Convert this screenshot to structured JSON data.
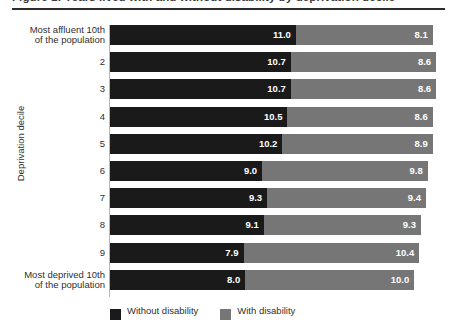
{
  "title": {
    "text": "Figure 1: Years lived with and without disability by deprivation decile"
  },
  "legend": {
    "items": [
      {
        "label": "Without disability",
        "color": "#1a1a1a"
      },
      {
        "label": "With disability",
        "color": "#767676"
      }
    ]
  },
  "axis": {
    "y_title": "Deprivation decile"
  },
  "chart_data": {
    "type": "bar",
    "orientation": "horizontal",
    "stacked": true,
    "title": "Figure 1: Years lived with and without disability by deprivation decile",
    "xlabel": "",
    "ylabel": "Deprivation decile",
    "grid": false,
    "legend_position": "bottom-left",
    "xlim": [
      0,
      19.1
    ],
    "categories": [
      "Most affluent 10th of the population",
      "2",
      "3",
      "4",
      "5",
      "6",
      "7",
      "8",
      "9",
      "Most deprived 10th of the population"
    ],
    "category_lines": [
      [
        "Most affluent 10th",
        "of the population"
      ],
      [
        "2"
      ],
      [
        "3"
      ],
      [
        "4"
      ],
      [
        "5"
      ],
      [
        "6"
      ],
      [
        "7"
      ],
      [
        "8"
      ],
      [
        "9"
      ],
      [
        "Most deprived 10th",
        "of the population"
      ]
    ],
    "series": [
      {
        "name": "Without disability",
        "color": "#1a1a1a",
        "values": [
          11.0,
          10.7,
          10.7,
          10.5,
          10.2,
          9.0,
          9.3,
          9.1,
          7.9,
          8.0
        ],
        "labels": [
          "11.0",
          "10.7",
          "10.7",
          "10.5",
          "10.2",
          "9.0",
          "9.3",
          "9.1",
          "7.9",
          "8.0"
        ]
      },
      {
        "name": "With disability",
        "color": "#767676",
        "values": [
          8.1,
          8.6,
          8.6,
          8.6,
          8.9,
          9.8,
          9.4,
          9.3,
          10.4,
          10.0
        ],
        "labels": [
          "8.1",
          "8.6",
          "8.6",
          "8.6",
          "8.9",
          "9.8",
          "9.4",
          "9.3",
          "10.4",
          "10.0"
        ]
      }
    ],
    "totals": [
      19.1,
      19.3,
      19.3,
      19.1,
      19.1,
      18.8,
      18.7,
      18.4,
      18.3,
      18.0
    ]
  }
}
